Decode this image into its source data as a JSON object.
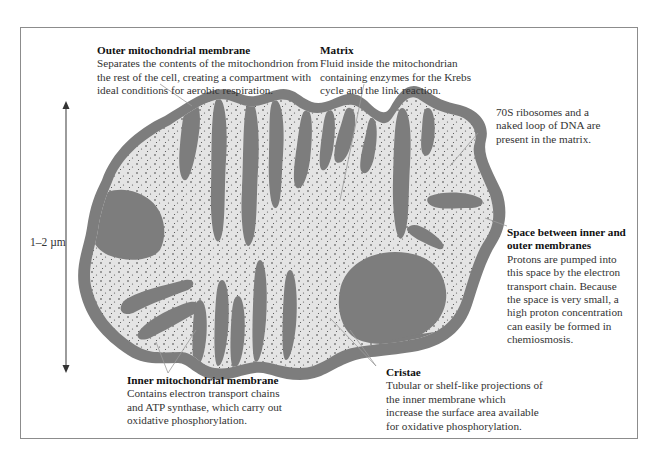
{
  "diagram": {
    "colors": {
      "membrane": "#7d7d7d",
      "matrix": "#e4e4e4",
      "dots": "#3a3a3a",
      "leader_lines": "#9a9a9a",
      "frame": "#8c8c8c",
      "text": "#333333"
    },
    "scale": {
      "label": "1–2 µm"
    },
    "labels": {
      "outer_membrane": {
        "title": "Outer mitochondrial membrane",
        "body": "Separates the contents of the mitochondrion from\nthe rest of the cell, creating a compartment with\nideal conditions for aerobic respiration."
      },
      "matrix": {
        "title": "Matrix",
        "body": "Fluid inside the mitochondrian\ncontaining enzymes for the Krebs\ncycle and the link reaction."
      },
      "ribosomes": {
        "body": "70S ribosomes and a\nnaked loop of DNA are\npresent in the matrix."
      },
      "intermembrane_space": {
        "title": "Space between inner and\nouter membranes",
        "body": "Protons are pumped into\nthis space by the electron\ntransport chain. Because\nthe space is very small, a\nhigh proton concentration\ncan easily be formed in\nchemiosmosis."
      },
      "inner_membrane": {
        "title": "Inner mitochondrial membrane",
        "body": "Contains electron transport chains\nand ATP synthase, which carry out\noxidative phosphorylation."
      },
      "cristae": {
        "title": "Cristae",
        "body": "Tubular or shelf-like projections of\nthe inner membrane which\nincrease the surface area available\nfor oxidative phosphorylation."
      }
    }
  }
}
